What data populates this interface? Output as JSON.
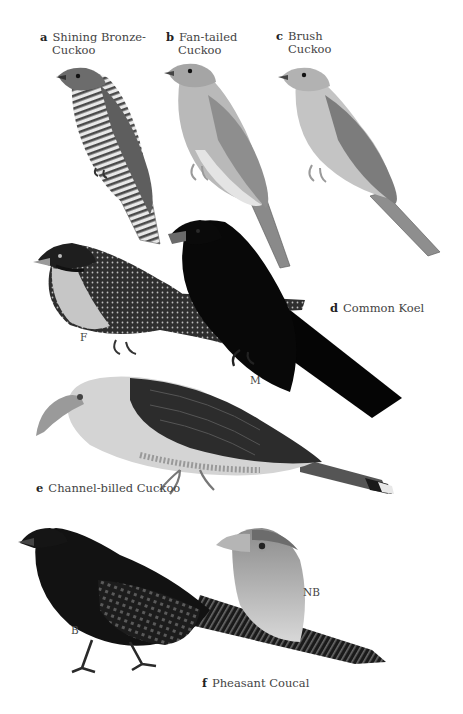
{
  "plate": {
    "species": [
      {
        "letter": "a",
        "name_line1": "Shining Bronze-",
        "name_line2": "Cuckoo"
      },
      {
        "letter": "b",
        "name_line1": "Fan-tailed",
        "name_line2": "Cuckoo"
      },
      {
        "letter": "c",
        "name_line1": "Brush",
        "name_line2": "Cuckoo"
      },
      {
        "letter": "d",
        "name": "Common Koel"
      },
      {
        "letter": "e",
        "name": "Channel-billed Cuckoo"
      },
      {
        "letter": "f",
        "name": "Pheasant Coucal"
      }
    ],
    "sub_labels": {
      "koel_female": "F",
      "koel_male": "M",
      "coucal_non_breeding": "NB",
      "coucal_breeding": "B"
    }
  }
}
